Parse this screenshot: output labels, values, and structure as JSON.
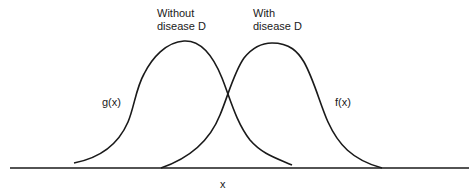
{
  "diagram": {
    "type": "overlapping-distributions",
    "curves": [
      {
        "id": "g",
        "function_label": "g(x)",
        "group_label_line1": "Without",
        "group_label_line2": "disease D"
      },
      {
        "id": "f",
        "function_label": "f(x)",
        "group_label_line1": "With",
        "group_label_line2": "disease D"
      }
    ],
    "x_axis_label": "x",
    "colors": {
      "stroke": "#1a1a1a",
      "background": "#ffffff"
    }
  }
}
